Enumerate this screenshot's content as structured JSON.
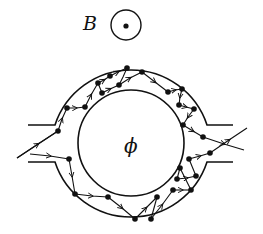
{
  "diagram": {
    "type": "physics-schematic",
    "field_label": "B",
    "field_symbol": "out-of-page (dot in circle)",
    "flux_label": "ϕ",
    "colors": {
      "ink": "#111111",
      "background": "#ffffff"
    },
    "components": [
      "magnetic-field-indicator",
      "annular-ring-conductor",
      "inner-flux-region",
      "left-input-lead",
      "right-output-lead",
      "electron-trajectories"
    ],
    "trajectories": {
      "upper_path": [
        [
          17,
          158
        ],
        [
          58,
          131
        ],
        [
          67,
          108
        ],
        [
          85,
          107
        ],
        [
          98,
          83
        ],
        [
          110,
          76
        ],
        [
          127,
          68
        ],
        [
          119,
          85
        ],
        [
          102,
          93
        ],
        [
          142,
          72
        ],
        [
          168,
          92
        ],
        [
          182,
          89
        ],
        [
          179,
          105
        ],
        [
          194,
          109
        ],
        [
          183,
          125
        ],
        [
          203,
          137
        ],
        [
          244,
          150
        ]
      ],
      "lower_path": [
        [
          30,
          154
        ],
        [
          69,
          159
        ],
        [
          75,
          194
        ],
        [
          108,
          197
        ],
        [
          135,
          219
        ],
        [
          151,
          219
        ],
        [
          157,
          197
        ],
        [
          151,
          219
        ],
        [
          173,
          190
        ],
        [
          191,
          190
        ],
        [
          177,
          179
        ],
        [
          196,
          176
        ],
        [
          180,
          168
        ],
        [
          191,
          190
        ],
        [
          189,
          159
        ],
        [
          210,
          153
        ],
        [
          247,
          128
        ]
      ]
    }
  }
}
